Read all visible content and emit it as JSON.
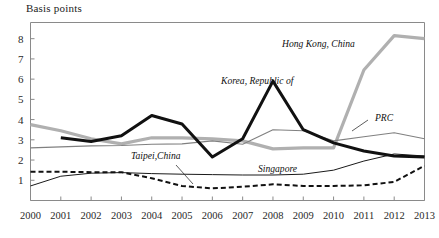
{
  "chart_data": {
    "type": "line",
    "title": "",
    "ylabel": "Basis points",
    "xlabel": "",
    "grid": false,
    "legend_position": "inline-annotations",
    "ylim": [
      0,
      8.8
    ],
    "yticks": [
      1,
      2,
      3,
      4,
      5,
      6,
      7,
      8
    ],
    "categories": [
      2000,
      2001,
      2002,
      2003,
      2004,
      2005,
      2006,
      2007,
      2008,
      2009,
      2010,
      2011,
      2012,
      2013
    ],
    "xtick_labels": [
      "2000",
      "2001",
      "2002",
      "2003",
      "2004",
      "2005",
      "2006",
      "2007",
      "2008",
      "2009",
      "2010",
      "2011",
      "2012",
      "2013"
    ],
    "series": [
      {
        "name": "Hong Kong, China",
        "style": "thick-light-gray",
        "color": "#b0b0b0",
        "x": [
          2000,
          2001,
          2002,
          2003,
          2004,
          2005,
          2006,
          2007,
          2008,
          2009,
          2010,
          2011,
          2012,
          2013
        ],
        "values": [
          3.75,
          3.45,
          3.05,
          2.8,
          3.1,
          3.1,
          3.05,
          2.95,
          2.55,
          2.6,
          2.6,
          6.45,
          8.15,
          8.0
        ]
      },
      {
        "name": "Korea, Republic of",
        "style": "thick-black",
        "color": "#111111",
        "x": [
          2001,
          2002,
          2003,
          2004,
          2005,
          2006,
          2007,
          2008,
          2009,
          2010,
          2011,
          2012,
          2013
        ],
        "values": [
          3.1,
          2.92,
          3.2,
          4.2,
          3.78,
          2.15,
          3.05,
          5.9,
          3.5,
          2.85,
          2.45,
          2.2,
          2.15
        ]
      },
      {
        "name": "PRC",
        "style": "thin-gray",
        "color": "#808080",
        "x": [
          2000,
          2001,
          2002,
          2003,
          2004,
          2005,
          2006,
          2007,
          2008,
          2009,
          2010,
          2011,
          2012,
          2013
        ],
        "values": [
          2.6,
          2.65,
          2.7,
          2.72,
          2.78,
          2.8,
          2.95,
          2.78,
          3.5,
          3.45,
          2.95,
          3.15,
          3.35,
          3.05
        ]
      },
      {
        "name": "Singapore",
        "style": "thin-black",
        "color": "#1a1a1a",
        "x": [
          2000,
          2001,
          2002,
          2003,
          2004,
          2005,
          2006,
          2007,
          2008,
          2009,
          2010,
          2011,
          2012,
          2013
        ],
        "values": [
          0.72,
          1.2,
          1.35,
          1.38,
          1.33,
          1.3,
          1.28,
          1.26,
          1.26,
          1.3,
          1.5,
          1.95,
          2.3,
          2.2
        ]
      },
      {
        "name": "Taipei,China",
        "style": "dashed-black",
        "color": "#111111",
        "x": [
          2000,
          2001,
          2002,
          2003,
          2004,
          2005,
          2006,
          2007,
          2008,
          2009,
          2010,
          2011,
          2012,
          2013
        ],
        "values": [
          1.42,
          1.42,
          1.4,
          1.4,
          1.1,
          0.72,
          0.6,
          0.68,
          0.8,
          0.72,
          0.72,
          0.75,
          0.92,
          1.72
        ]
      }
    ],
    "annotations": [
      {
        "name": "Hong Kong, China",
        "text": "Hong Kong, China",
        "x": 282,
        "y": 47
      },
      {
        "name": "Korea, Republic of",
        "text": "Korea, Republic of",
        "x": 221,
        "y": 84
      },
      {
        "name": "PRC",
        "text": "PRC",
        "x": 375,
        "y": 121
      },
      {
        "name": "Singapore",
        "text": "Singapore",
        "x": 258,
        "y": 172
      },
      {
        "name": "Taipei,China",
        "text": "Taipei,China",
        "x": 131,
        "y": 159
      }
    ]
  }
}
